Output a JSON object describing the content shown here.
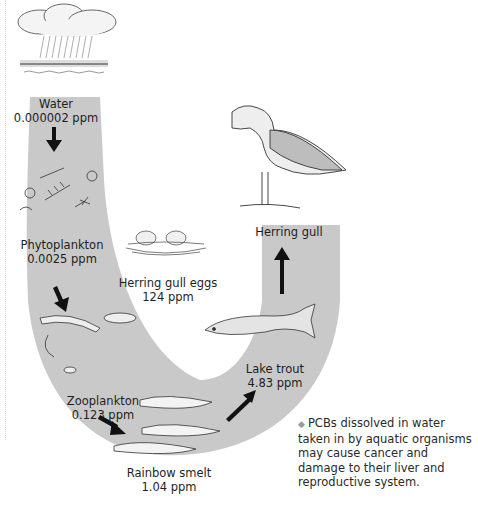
{
  "diagram": {
    "stages": [
      {
        "name": "Water",
        "concentration": "0.000002 ppm"
      },
      {
        "name": "Phytoplankton",
        "concentration": "0.0025 ppm"
      },
      {
        "name": "Zooplankton",
        "concentration": "0.123 ppm"
      },
      {
        "name": "Rainbow smelt",
        "concentration": "1.04 ppm"
      },
      {
        "name": "Lake trout",
        "concentration": "4.83 ppm"
      },
      {
        "name": "Herring gull",
        "concentration": ""
      }
    ],
    "side_item": {
      "name": "Herring gull eggs",
      "concentration": "124 ppm"
    },
    "note": "PCBs dissolved in water taken in by aquatic organisms may cause cancer and damage to their liver and reproductive system.",
    "colors": {
      "band": "#c9c9c9",
      "arrow": "#111111",
      "text": "#1e1e1e"
    }
  }
}
